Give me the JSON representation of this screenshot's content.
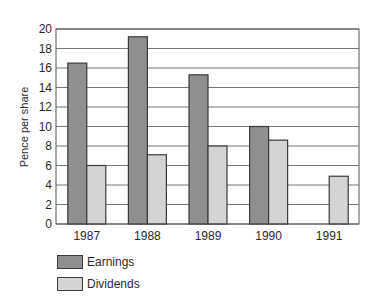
{
  "chart_data": {
    "type": "bar",
    "title": "",
    "xlabel": "",
    "ylabel": "Pence per share",
    "ylim": [
      0,
      20
    ],
    "yticks": [
      0,
      2,
      4,
      6,
      8,
      10,
      12,
      14,
      16,
      18,
      20
    ],
    "grid": true,
    "legend_position": "bottom-left",
    "categories": [
      "1987",
      "1988",
      "1989",
      "1990",
      "1991"
    ],
    "series": [
      {
        "name": "Earnings",
        "color": "#8f8f8f",
        "values": [
          16.5,
          19.2,
          15.3,
          10.0,
          null
        ]
      },
      {
        "name": "Dividends",
        "color": "#d4d4d4",
        "values": [
          6.0,
          7.1,
          8.0,
          8.6,
          4.9
        ]
      }
    ]
  }
}
